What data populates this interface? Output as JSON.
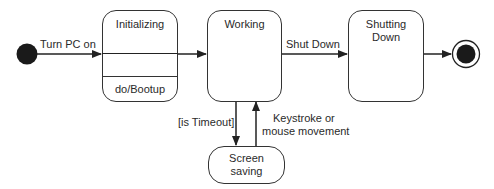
{
  "diagram": {
    "type": "UML state machine",
    "states": [
      {
        "id": "initializing",
        "name": "Initializing",
        "activity": "do/Bootup"
      },
      {
        "id": "working",
        "name": "Working"
      },
      {
        "id": "shutting_down",
        "name": "Shutting Down",
        "name_line1": "Shutting",
        "name_line2": "Down"
      },
      {
        "id": "screen_saving",
        "name": "Screen saving",
        "name_line1": "Screen",
        "name_line2": "saving"
      }
    ],
    "pseudostates": {
      "initial": "initial-state",
      "final": "final-state"
    },
    "transitions": [
      {
        "from": "initial",
        "to": "initializing",
        "label": "Turn PC on"
      },
      {
        "from": "initializing",
        "to": "working",
        "label": ""
      },
      {
        "from": "working",
        "to": "shutting_down",
        "label": "Shut Down"
      },
      {
        "from": "shutting_down",
        "to": "final",
        "label": ""
      },
      {
        "from": "working",
        "to": "screen_saving",
        "label": "[is Timeout]"
      },
      {
        "from": "screen_saving",
        "to": "working",
        "label": "Keystroke or mouse movement",
        "label_line1": "Keystroke or",
        "label_line2": "mouse movement"
      }
    ],
    "colors": {
      "line": "#333333",
      "fill": "#ffffff",
      "node": "#1a1a1a"
    }
  }
}
